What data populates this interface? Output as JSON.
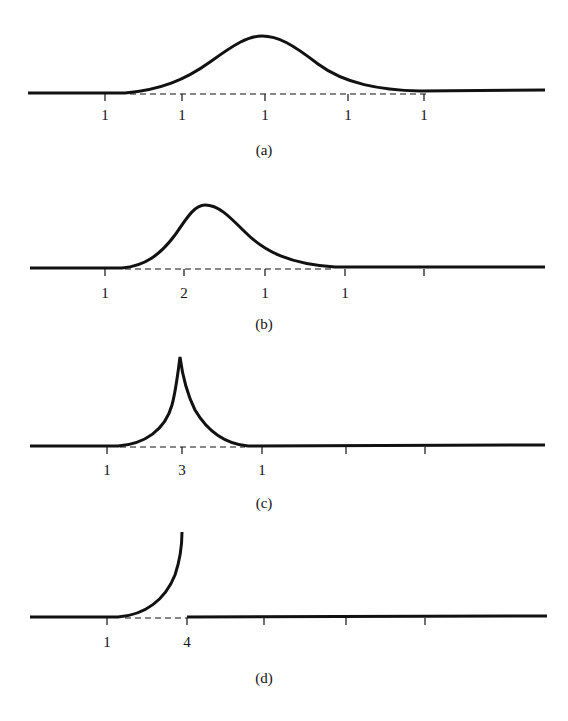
{
  "panels": [
    {
      "id": "a",
      "caption": "(a)",
      "tick_labels": [
        "1",
        "1",
        "1",
        "1",
        "1"
      ]
    },
    {
      "id": "b",
      "caption": "(b)",
      "tick_labels": [
        "1",
        "2",
        "1",
        "1",
        ""
      ]
    },
    {
      "id": "c",
      "caption": "(c)",
      "tick_labels": [
        "1",
        "3",
        "1",
        "",
        ""
      ]
    },
    {
      "id": "d",
      "caption": "(d)",
      "tick_labels": [
        "1",
        "4",
        "",
        "",
        ""
      ]
    }
  ],
  "colors": {
    "ink": "#111111",
    "background": "#ffffff"
  }
}
